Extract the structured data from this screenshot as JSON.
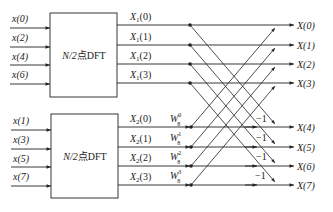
{
  "diagram": {
    "type": "DIT-FFT butterfly (8-point, first stage decomposition)",
    "colors": {
      "line": "#222222",
      "background": "#ffffff"
    },
    "blocks": [
      {
        "label": "N/2点DFT",
        "inputs": [
          "x(0)",
          "x(2)",
          "x(4)",
          "x(6)"
        ],
        "outputs": [
          "X1(0)",
          "X1(1)",
          "X1(2)",
          "X1(3)"
        ]
      },
      {
        "label": "N/2点DFT",
        "inputs": [
          "x(1)",
          "x(3)",
          "x(5)",
          "x(7)"
        ],
        "outputs": [
          "X2(0)",
          "X2(1)",
          "X2(2)",
          "X2(3)"
        ]
      }
    ],
    "block_label_main": "N/2",
    "block_label_suffix": "点DFT",
    "top_inputs": [
      "x(0)",
      "x(2)",
      "x(4)",
      "x(6)"
    ],
    "bottom_inputs": [
      "x(1)",
      "x(3)",
      "x(5)",
      "x(7)"
    ],
    "top_outputs_sym": "X",
    "top_outputs_sub": "1",
    "bottom_outputs_sub": "2",
    "indices": [
      "(0)",
      "(1)",
      "(2)",
      "(3)"
    ],
    "twiddles": [
      {
        "base": "W",
        "sup": "0",
        "sub": "8"
      },
      {
        "base": "W",
        "sup": "1",
        "sub": "8"
      },
      {
        "base": "W",
        "sup": "2",
        "sub": "8"
      },
      {
        "base": "W",
        "sup": "3",
        "sub": "8"
      }
    ],
    "minus_one": "−1",
    "final_outputs": [
      "X(0)",
      "X(1)",
      "X(2)",
      "X(3)",
      "X(4)",
      "X(5)",
      "X(6)",
      "X(7)"
    ]
  }
}
